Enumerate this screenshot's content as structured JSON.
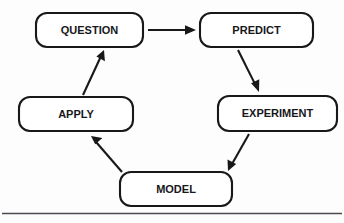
{
  "diagram": {
    "type": "cycle-flow-diagram",
    "canvas": {
      "width": 344,
      "height": 223
    },
    "colors": {
      "background": "#fdfdfd",
      "box_fill": "#ffffff",
      "box_stroke": "#18181b",
      "text": "#17171a",
      "arrow": "#18181b",
      "rule": "#4a4a50"
    },
    "nodes": [
      {
        "id": "question",
        "label": "QUESTION",
        "x": 36,
        "y": 13,
        "width": 107,
        "height": 34,
        "cx": 89.5,
        "cy": 30,
        "rx": 11,
        "font_size": 11
      },
      {
        "id": "predict",
        "label": "PREDICT",
        "x": 200,
        "y": 13,
        "width": 113,
        "height": 34,
        "cx": 256.5,
        "cy": 30,
        "rx": 11,
        "font_size": 11
      },
      {
        "id": "experiment",
        "label": "EXPERIMENT",
        "x": 218,
        "y": 96,
        "width": 119,
        "height": 35,
        "cx": 277.5,
        "cy": 113.5,
        "rx": 11,
        "font_size": 11
      },
      {
        "id": "apply",
        "label": "APPLY",
        "x": 19,
        "y": 97,
        "width": 114,
        "height": 34,
        "cx": 76,
        "cy": 114,
        "rx": 11,
        "font_size": 11
      },
      {
        "id": "model",
        "label": "MODEL",
        "x": 120,
        "y": 172,
        "width": 112,
        "height": 34,
        "cx": 176,
        "cy": 189,
        "rx": 11,
        "font_size": 11
      }
    ],
    "edges": [
      {
        "id": "question-to-predict",
        "from": "question",
        "to": "predict",
        "x1": 148,
        "y1": 30,
        "x2": 196,
        "y2": 30,
        "head_size": 7.5
      },
      {
        "id": "predict-to-experiment",
        "from": "predict",
        "to": "experiment",
        "x1": 238,
        "y1": 50,
        "x2": 259,
        "y2": 92,
        "head_size": 7.5
      },
      {
        "id": "experiment-to-model",
        "from": "experiment",
        "to": "model",
        "x1": 249,
        "y1": 134,
        "x2": 228,
        "y2": 171,
        "head_size": 7.5
      },
      {
        "id": "model-to-apply",
        "from": "model",
        "to": "apply",
        "x1": 122,
        "y1": 172,
        "x2": 91,
        "y2": 136,
        "head_size": 7.5
      },
      {
        "id": "apply-to-question",
        "from": "apply",
        "to": "question",
        "x1": 83,
        "y1": 95,
        "x2": 104,
        "y2": 50,
        "head_size": 7.5
      }
    ],
    "rules": [
      {
        "id": "bottom-rule",
        "x1": 2,
        "y1": 213.5,
        "x2": 342,
        "y2": 213.5
      }
    ]
  }
}
